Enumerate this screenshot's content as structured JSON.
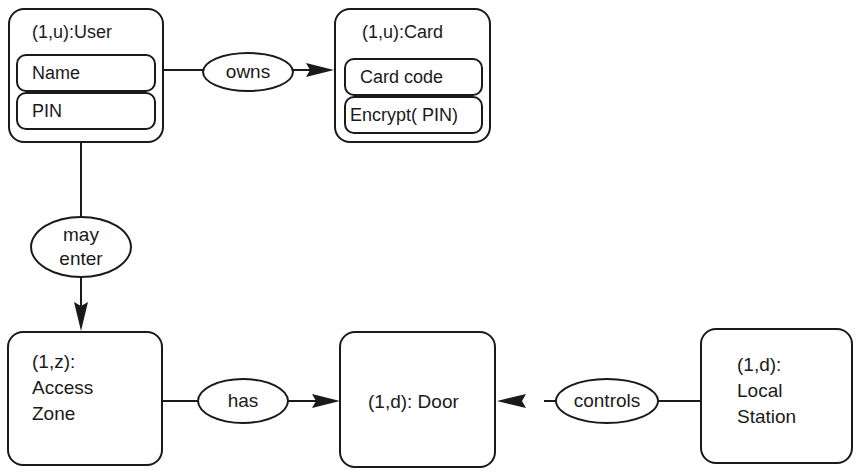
{
  "diagram": {
    "entities": {
      "user": {
        "title": "(1,u):User",
        "attributes": [
          "Name",
          "PIN"
        ]
      },
      "card": {
        "title": "(1,u):Card",
        "attributes": [
          "Card code",
          "Encrypt( PIN)"
        ]
      },
      "access_zone": {
        "lines": [
          "(1,z):",
          "Access",
          "Zone"
        ]
      },
      "door": {
        "title": "(1,d): Door"
      },
      "local_station": {
        "lines": [
          "(1,d):",
          "Local",
          "Station"
        ]
      }
    },
    "relations": {
      "owns": "owns",
      "may_enter": [
        "may",
        "enter"
      ],
      "has": "has",
      "controls": "controls"
    }
  }
}
